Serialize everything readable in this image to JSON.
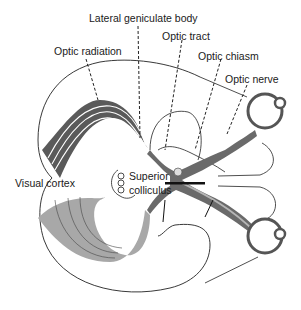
{
  "diagram": {
    "type": "anatomical-diagram",
    "labels": {
      "lateral_geniculate_body": "Lateral geniculate body",
      "optic_tract": "Optic tract",
      "optic_radiation": "Optic radiation",
      "optic_chiasm": "Optic chiasm",
      "optic_nerve": "Optic nerve",
      "visual_cortex": "Visual cortex",
      "superior": "Superior",
      "colliculus": "colliculus"
    },
    "colors": {
      "dark_pathway": "#5a5a5a",
      "light_pathway": "#a8a8a8",
      "outline": "#222222",
      "background": "#ffffff"
    }
  }
}
